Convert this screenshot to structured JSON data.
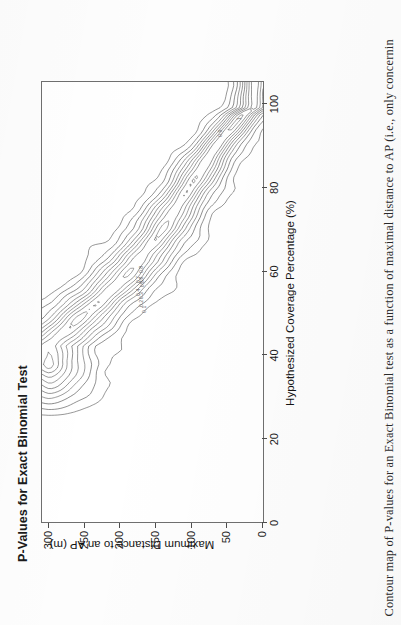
{
  "figure": {
    "title": "P-Values for Exact Binomial Test",
    "caption": "Contour map of P-values for an Exact Binomial test as a function of maximal distance to AP (i.e., only concernin"
  },
  "chart_data": {
    "type": "heatmap",
    "subtype": "contour",
    "title": "P-Values for Exact Binomial Test",
    "xlabel": "Hypothesized Coverage Percentage (%)",
    "ylabel": "Maximum Distance to an AP (m)",
    "xlim": [
      0,
      105
    ],
    "ylim": [
      0,
      310
    ],
    "xticks": [
      0,
      20,
      40,
      60,
      80,
      100
    ],
    "xticklabels": [
      "0",
      "20",
      "40",
      "60",
      "80",
      "100"
    ],
    "yticks": [
      0,
      50,
      100,
      150,
      200,
      250,
      300
    ],
    "yticklabels": [
      "0",
      "50",
      "100",
      "150",
      "200",
      "250",
      "300"
    ],
    "grid": false,
    "legend": "none",
    "contour_levels": [
      0.1,
      0.2,
      0.3,
      0.4,
      0.5,
      0.6,
      0.7,
      0.8,
      0.9,
      1.0
    ],
    "contour_labels": [
      "0.1",
      "0.2",
      "0.3",
      "0.4",
      "0.5",
      "0.6",
      "0.7",
      "0.8",
      "0.9",
      "1"
    ],
    "value_range": [
      0.0,
      1.0
    ],
    "zlabel": "P-value",
    "ridge_points": [
      {
        "x": 42,
        "y": 300
      },
      {
        "x": 48,
        "y": 260
      },
      {
        "x": 55,
        "y": 215
      },
      {
        "x": 62,
        "y": 175
      },
      {
        "x": 70,
        "y": 140
      },
      {
        "x": 78,
        "y": 110
      },
      {
        "x": 86,
        "y": 80
      },
      {
        "x": 92,
        "y": 55
      },
      {
        "x": 97,
        "y": 30
      },
      {
        "x": 99,
        "y": 12
      }
    ]
  },
  "axes": {
    "x": {
      "title": "Hypothesized Coverage Percentage (%)",
      "ticks": [
        "0",
        "20",
        "40",
        "60",
        "80",
        "100"
      ]
    },
    "y": {
      "title": "Maximum Distance to an AP (m)",
      "ticks": [
        "0",
        "50",
        "100",
        "150",
        "200",
        "250",
        "300"
      ]
    }
  }
}
